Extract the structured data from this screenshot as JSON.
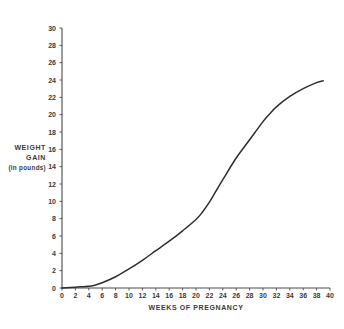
{
  "chart_data": {
    "type": "line",
    "title": "",
    "xlabel": "WEEKS OF PREGNANCY",
    "ylabel_lines": [
      "WEIGHT",
      "GAIN",
      "(in pounds)"
    ],
    "ylabel": "WEIGHT GAIN (in pounds)",
    "xlim": [
      0,
      40
    ],
    "ylim": [
      0,
      30
    ],
    "xticks": [
      0,
      2,
      4,
      6,
      8,
      10,
      12,
      14,
      16,
      18,
      20,
      22,
      24,
      26,
      28,
      30,
      32,
      34,
      36,
      38,
      40
    ],
    "yticks": [
      0,
      2,
      4,
      6,
      8,
      10,
      12,
      14,
      16,
      18,
      20,
      22,
      24,
      26,
      28,
      30
    ],
    "xtick_labels": [
      "0",
      "2",
      "4",
      "6",
      "8",
      "10",
      "12",
      "14",
      "16",
      "18",
      "20",
      "22",
      "24",
      "26",
      "28",
      "30",
      "32",
      "34",
      "36",
      "38",
      "40"
    ],
    "ytick_labels": [
      "0",
      "2",
      "4",
      "6",
      "8",
      "10",
      "12",
      "14",
      "16",
      "18",
      "20",
      "22",
      "24",
      "26",
      "28",
      "30"
    ],
    "grid": false,
    "legend": false,
    "legend_position": "none",
    "line_color": "#2e2e2e",
    "axis_color": "#4a4a4a",
    "background_color": "#ffffff",
    "series": [
      {
        "name": "Weight gain",
        "x": [
          0,
          2,
          4,
          5,
          6,
          8,
          10,
          12,
          14,
          16,
          18,
          20,
          21,
          22,
          23,
          24,
          26,
          28,
          30,
          31,
          32,
          34,
          36,
          38,
          39
        ],
        "values": [
          0,
          0.1,
          0.2,
          0.35,
          0.6,
          1.3,
          2.2,
          3.2,
          4.3,
          5.4,
          6.6,
          7.9,
          8.8,
          9.9,
          11.2,
          12.5,
          15.0,
          17.1,
          19.2,
          20.1,
          20.9,
          22.1,
          23.0,
          23.7,
          23.9
        ]
      }
    ]
  },
  "geometry": {
    "plot_left": 62,
    "plot_right": 330,
    "plot_top": 28,
    "plot_bottom": 288
  }
}
